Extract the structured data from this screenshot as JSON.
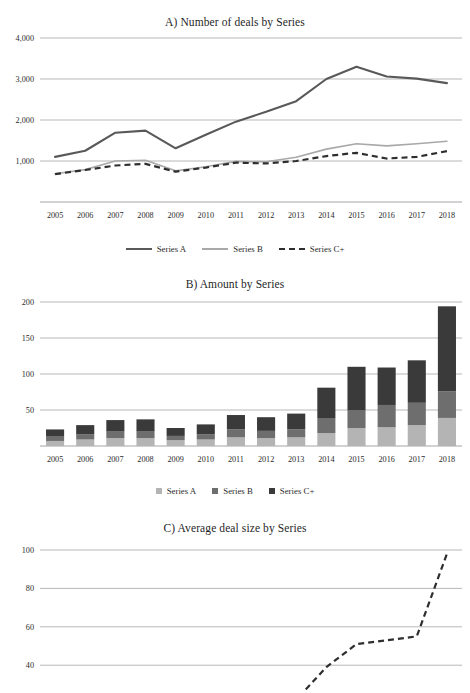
{
  "figure": {
    "background": "#ffffff",
    "width": 470,
    "height": 693
  },
  "colors": {
    "series_a": "#595959",
    "series_b": "#a9a9a9",
    "series_c": "#2e2e2e",
    "bar_a": "#b4b4b4",
    "bar_b": "#6e6e6e",
    "bar_c": "#3a3a3a",
    "grid": "#9a9a9a",
    "text": "#2b2b2b"
  },
  "panels": {
    "a": {
      "title": "A) Number of deals by Series",
      "legend": [
        {
          "label": "Series A",
          "style": "solid",
          "color": "#595959"
        },
        {
          "label": "Series B",
          "style": "solid",
          "color": "#a9a9a9"
        },
        {
          "label": "Series C+",
          "style": "dashed",
          "color": "#2e2e2e"
        }
      ]
    },
    "b": {
      "title": "B) Amount by Series",
      "legend": [
        {
          "label": "Series A",
          "style": "square",
          "color": "#b4b4b4"
        },
        {
          "label": "Series B",
          "style": "square",
          "color": "#6e6e6e"
        },
        {
          "label": "Series C+",
          "style": "square",
          "color": "#3a3a3a"
        }
      ]
    },
    "c": {
      "title": "C) Average deal size by Series",
      "legend": []
    }
  },
  "chart_data": [
    {
      "id": "panel-a",
      "type": "line",
      "title": "A) Number of deals by Series",
      "xlabel": "",
      "ylabel": "",
      "x": [
        2005,
        2006,
        2007,
        2008,
        2009,
        2010,
        2011,
        2012,
        2013,
        2014,
        2015,
        2016,
        2017,
        2018
      ],
      "categories": [
        "2005",
        "2006",
        "2007",
        "2008",
        "2009",
        "2010",
        "2011",
        "2012",
        "2013",
        "2014",
        "2015",
        "2016",
        "2017",
        "2018"
      ],
      "yticks": [
        1000,
        2000,
        3000,
        4000
      ],
      "ytick_labels": [
        "1,000",
        "2,000",
        "3,000",
        "4,000"
      ],
      "ylim": [
        0,
        4000
      ],
      "grid": true,
      "legend_position": "bottom",
      "series": [
        {
          "name": "Series A",
          "style": "solid",
          "color": "#595959",
          "values": [
            1100,
            1250,
            1690,
            1740,
            1310,
            1640,
            1960,
            2200,
            2460,
            3000,
            3300,
            3060,
            3010,
            2900
          ]
        },
        {
          "name": "Series B",
          "style": "solid",
          "color": "#a9a9a9",
          "values": [
            690,
            790,
            1000,
            1020,
            760,
            860,
            990,
            980,
            1090,
            1290,
            1420,
            1370,
            1420,
            1480
          ]
        },
        {
          "name": "Series C+",
          "style": "dashed",
          "color": "#2e2e2e",
          "values": [
            680,
            780,
            890,
            930,
            740,
            840,
            960,
            940,
            1000,
            1120,
            1200,
            1060,
            1100,
            1240
          ]
        }
      ]
    },
    {
      "id": "panel-b",
      "type": "bar",
      "stacked": true,
      "title": "B) Amount by Series",
      "xlabel": "",
      "ylabel": "",
      "categories": [
        "2005",
        "2006",
        "2007",
        "2008",
        "2009",
        "2010",
        "2011",
        "2012",
        "2013",
        "2014",
        "2015",
        "2016",
        "2017",
        "2018"
      ],
      "yticks": [
        50,
        100,
        150,
        200
      ],
      "ytick_labels": [
        "50",
        "100",
        "150",
        "200"
      ],
      "ylim": [
        0,
        200
      ],
      "grid": true,
      "legend_position": "bottom",
      "series": [
        {
          "name": "Series A",
          "color": "#b4b4b4",
          "values": [
            7,
            9,
            11,
            11,
            8,
            9,
            12,
            11,
            12,
            18,
            25,
            26,
            29,
            39
          ]
        },
        {
          "name": "Series B",
          "color": "#6e6e6e",
          "values": [
            6,
            7,
            9,
            9,
            6,
            7,
            11,
            10,
            11,
            20,
            25,
            31,
            31,
            37
          ]
        },
        {
          "name": "Series C+",
          "color": "#3a3a3a",
          "values": [
            10,
            13,
            16,
            17,
            11,
            14,
            20,
            19,
            22,
            43,
            60,
            52,
            59,
            118
          ]
        }
      ],
      "totals": [
        23,
        29,
        36,
        37,
        25,
        30,
        43,
        40,
        45,
        81,
        110,
        109,
        119,
        194
      ]
    },
    {
      "id": "panel-c",
      "type": "line",
      "title": "C) Average deal size by Series",
      "xlabel": "",
      "ylabel": "",
      "note": "panel cropped at bottom of screenshot",
      "x": [
        2005,
        2006,
        2007,
        2008,
        2009,
        2010,
        2011,
        2012,
        2013,
        2014,
        2015,
        2016,
        2017,
        2018
      ],
      "categories": [
        "2005",
        "2006",
        "2007",
        "2008",
        "2009",
        "2010",
        "2011",
        "2012",
        "2013",
        "2014",
        "2015",
        "2016",
        "2017",
        "2018"
      ],
      "yticks": [
        20,
        40,
        60,
        80,
        100
      ],
      "ytick_labels": [
        "20",
        "40",
        "60",
        "80",
        "100"
      ],
      "ylim": [
        0,
        100
      ],
      "grid": true,
      "legend_position": "bottom",
      "series": [
        {
          "name": "Series A",
          "style": "solid",
          "color": "#a9a9a9",
          "values": [
            6,
            7,
            7,
            7,
            6,
            6,
            7,
            7,
            7,
            10,
            14,
            18,
            22,
            26
          ]
        },
        {
          "name": "Series B",
          "style": "solid",
          "color": "#a9a9a9",
          "values": [
            8,
            9,
            9,
            9,
            8,
            8,
            11,
            10,
            10,
            15,
            18,
            21,
            22,
            26
          ]
        },
        {
          "name": "Series C+",
          "style": "dashed",
          "color": "#2e2e2e",
          "values": [
            14,
            16,
            18,
            18,
            15,
            17,
            24,
            21,
            22,
            39,
            51,
            53,
            55,
            98
          ]
        }
      ]
    }
  ]
}
